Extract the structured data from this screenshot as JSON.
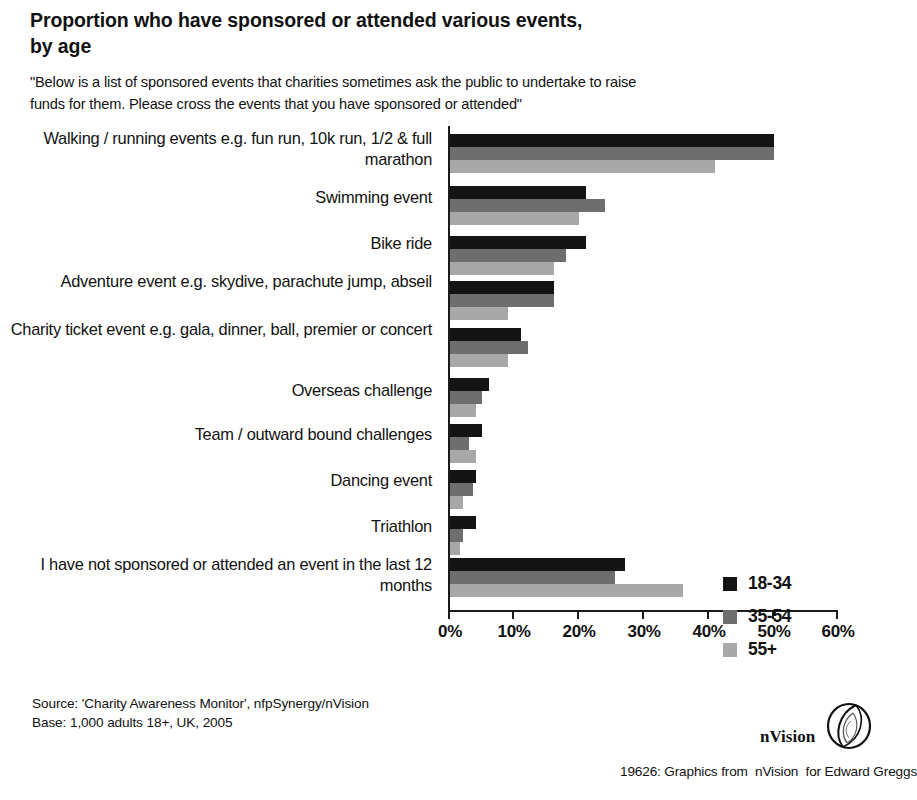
{
  "header": {
    "title": "Proportion who have sponsored or attended various events, by age",
    "subtitle": "\"Below is a list of sponsored events that charities sometimes ask the public to undertake to raise funds for them.  Please cross the events that you have sponsored or attended\""
  },
  "footer": {
    "source": "Source: 'Charity Awareness Monitor', nfpSynergy/nVision",
    "base": "Base: 1,000 adults 18+, UK, 2005",
    "logo_word": "nVision",
    "credit": "19626: Graphics from  nVision  for Edward Greggs"
  },
  "colors": {
    "series_18_34": "#141414",
    "series_35_54": "#6e6e6e",
    "series_55_plus": "#a8a8a8",
    "axis": "#1a1a1a",
    "background": "#ffffff"
  },
  "chart_data": {
    "type": "bar",
    "orientation": "horizontal",
    "title": "Proportion who have sponsored or attended various events, by age",
    "xlabel": "",
    "ylabel": "",
    "xlim": [
      0,
      60
    ],
    "grid": false,
    "legend_position": "inside-right",
    "tick_labels": [
      "0%",
      "10%",
      "20%",
      "30%",
      "40%",
      "50%",
      "60%"
    ],
    "tick_values": [
      0,
      10,
      20,
      30,
      40,
      50,
      60
    ],
    "categories": [
      "Walking / running events e.g. fun run, 10k run, 1/2 & full marathon",
      "Swimming event",
      "Bike ride",
      "Adventure event e.g. skydive, parachute jump, abseil",
      "Charity ticket event e.g. gala, dinner, ball, premier or concert",
      "Overseas challenge",
      "Team / outward bound challenges",
      "Dancing event",
      "Triathlon",
      "I have not sponsored or attended an event in the last 12 months"
    ],
    "series": [
      {
        "name": "18-34",
        "color": "#141414",
        "values": [
          50,
          21,
          21,
          16,
          11,
          6,
          5,
          4,
          4,
          27
        ]
      },
      {
        "name": "35-54",
        "color": "#6e6e6e",
        "values": [
          50,
          24,
          18,
          16,
          12,
          5,
          3,
          3.5,
          2,
          25.5
        ]
      },
      {
        "name": "55+",
        "color": "#a8a8a8",
        "values": [
          41,
          20,
          16,
          9,
          9,
          4,
          4,
          2,
          1.5,
          36
        ]
      }
    ]
  }
}
